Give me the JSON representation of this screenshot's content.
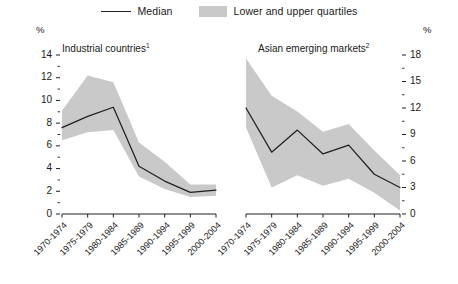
{
  "legend": {
    "median": {
      "label": "Median",
      "marker": "line-marker",
      "color": "#231f20"
    },
    "quartiles": {
      "label": "Lower and upper quartiles",
      "marker": "band-swatch",
      "color": "#c9c9c9"
    }
  },
  "axis_unit_left": "%",
  "axis_unit_right": "%",
  "panels": {
    "left": {
      "title": "Industrial countries",
      "footnote_marker": "1"
    },
    "right": {
      "title": "Asian emerging markets",
      "footnote_marker": "2"
    }
  },
  "chart_data": [
    {
      "type": "area",
      "title": "Industrial countries",
      "subtitle": "",
      "xlabel": "",
      "ylabel": "%",
      "ylim": [
        0,
        14
      ],
      "yticks": [
        0,
        2,
        4,
        6,
        8,
        10,
        12,
        14
      ],
      "ytick_labels": [
        "0",
        "2",
        "4",
        "6",
        "8",
        "10",
        "12",
        "14"
      ],
      "minor_ticks": [
        1,
        3,
        5,
        7,
        9,
        11,
        13
      ],
      "grid": false,
      "legend_position": "top-center",
      "axis_side": "left",
      "categories": [
        "1970-1974",
        "1975-1979",
        "1980-1984",
        "1985-1989",
        "1990-1994",
        "1995-1999",
        "2000-2004"
      ],
      "series": [
        {
          "name": "Median",
          "values": [
            7.6,
            8.6,
            9.4,
            4.2,
            2.9,
            1.9,
            2.1
          ]
        },
        {
          "name": "Lower quartile",
          "values": [
            6.5,
            7.2,
            7.4,
            3.3,
            2.2,
            1.5,
            1.6
          ]
        },
        {
          "name": "Upper quartile",
          "values": [
            9.1,
            12.2,
            11.6,
            6.3,
            4.6,
            2.6,
            2.6
          ]
        }
      ]
    },
    {
      "type": "area",
      "title": "Asian emerging markets",
      "subtitle": "",
      "xlabel": "",
      "ylabel": "%",
      "ylim": [
        0,
        18
      ],
      "yticks": [
        0,
        3,
        6,
        9,
        12,
        15,
        18
      ],
      "ytick_labels": [
        "0",
        "3",
        "6",
        "9",
        "12",
        "15",
        "18"
      ],
      "minor_ticks": [
        1.5,
        4.5,
        7.5,
        10.5,
        13.5,
        16.5
      ],
      "grid": false,
      "legend_position": "top-center",
      "axis_side": "right",
      "categories": [
        "1970-1974",
        "1975-1979",
        "1980-1984",
        "1985-1989",
        "1990-1994",
        "1995-1999",
        "2000-2004"
      ],
      "series": [
        {
          "name": "Median",
          "values": [
            12.0,
            7.0,
            9.5,
            6.8,
            7.8,
            4.5,
            3.0
          ]
        },
        {
          "name": "Lower quartile",
          "values": [
            9.8,
            3.0,
            4.4,
            3.2,
            4.0,
            2.4,
            0.4
          ]
        },
        {
          "name": "Upper quartile",
          "values": [
            17.6,
            13.4,
            11.6,
            9.3,
            10.2,
            7.2,
            4.4
          ]
        }
      ]
    }
  ]
}
